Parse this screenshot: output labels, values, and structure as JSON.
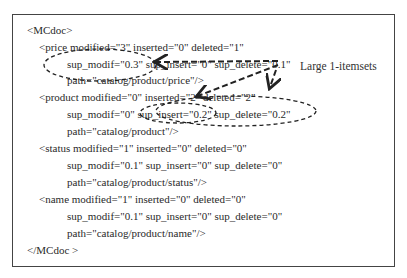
{
  "document": {
    "root_open": "<MCdoc>",
    "root_close": "</MCdoc >",
    "elements": [
      {
        "tag_line": "<price modified=\"3\" inserted=\"0\" deleted=\"1\"",
        "sup_line": "sup_modif=\"0.3\" sup_insert=\"0\" sup_delete=\"0.1\"",
        "path_line": "path=\"catalog/product/price\"/>"
      },
      {
        "tag_line": "<product modified=\"0\" inserted=\"2\" deleted=\"2\"",
        "sup_line": "sup_modif=\"0\" sup_insert=\"0.2\" sup_delete=\"0.2\"",
        "path_line": "path=\"catalog/product\"/>"
      },
      {
        "tag_line": "<status modified=\"1\" inserted=\"0\" deleted=\"0\"",
        "sup_line": "sup_modif=\"0.1\" sup_insert=\"0\" sup_delete=\"0\"",
        "path_line": "path=\"catalog/product/status\"/>"
      },
      {
        "tag_line": "<name modified=\"1\" inserted=\"0\" deleted=\"0\"",
        "sup_line": "sup_modif=\"0.1\" sup_insert=\"0\" sup_delete=\"0\"",
        "path_line": "path=\"catalog/product/name\"/>"
      }
    ]
  },
  "annotation": {
    "label": "Large 1-itemsets",
    "highlighted": [
      "sup_modif=\"0.3\"",
      "sup_insert=\"0.2\"",
      "sup_delete=\"0.2\""
    ]
  },
  "colors": {
    "border": "#444444",
    "text": "#2a2a2a",
    "dashes": "#222222"
  }
}
